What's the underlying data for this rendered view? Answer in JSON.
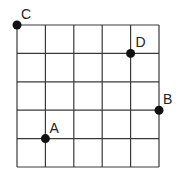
{
  "diagram": {
    "type": "grid-with-points",
    "grid": {
      "columns": 5,
      "rows": 5,
      "origin_px": [
        17,
        25
      ],
      "cell_px": 28.4,
      "line_color": "#3a3a3a"
    },
    "points": [
      {
        "label": "A",
        "col": 1,
        "row": 4,
        "label_offset": [
          4,
          -6
        ]
      },
      {
        "label": "B",
        "col": 5,
        "row": 3,
        "label_offset": [
          4,
          -6
        ]
      },
      {
        "label": "C",
        "col": 0,
        "row": 0,
        "label_offset": [
          4,
          -6
        ]
      },
      {
        "label": "D",
        "col": 4,
        "row": 1,
        "label_offset": [
          5,
          -6
        ]
      }
    ],
    "point_color": "#111111"
  }
}
